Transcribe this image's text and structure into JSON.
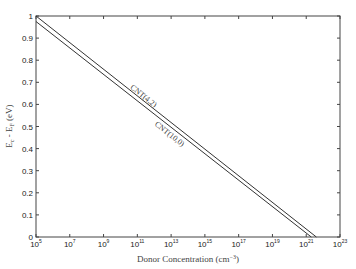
{
  "chart_data": {
    "type": "line",
    "title": "",
    "xlabel": "Donor Concentration (cm⁻³)",
    "ylabel": "Eᴄ - Eғ (eV)",
    "ylabel_parts": {
      "main": "E",
      "sub1": "c",
      "mid": " - E",
      "sub2": "F",
      "unit": " (eV)"
    },
    "xlabel_parts": {
      "main": "Donor Concentration (cm",
      "sup": "−3",
      "end": ")"
    },
    "xscale": "log",
    "xlim_exp": [
      5,
      23
    ],
    "ylim": [
      0,
      1
    ],
    "x_ticks": [
      {
        "base": "10",
        "exp": "5"
      },
      {
        "base": "10",
        "exp": "7"
      },
      {
        "base": "10",
        "exp": "9"
      },
      {
        "base": "10",
        "exp": "11"
      },
      {
        "base": "10",
        "exp": "13"
      },
      {
        "base": "10",
        "exp": "15"
      },
      {
        "base": "10",
        "exp": "17"
      },
      {
        "base": "10",
        "exp": "19"
      },
      {
        "base": "10",
        "exp": "21"
      },
      {
        "base": "10",
        "exp": "23"
      }
    ],
    "y_ticks": [
      "0",
      "0.1",
      "0.2",
      "0.3",
      "0.4",
      "0.5",
      "0.6",
      "0.7",
      "0.8",
      "0.9",
      "1"
    ],
    "grid": false,
    "legend": "none (inline annotations)",
    "series": [
      {
        "name": "CNT(4,2)",
        "x_log10": [
          5,
          21.6
        ],
        "y": [
          1.0,
          0.0
        ],
        "color": "#333333"
      },
      {
        "name": "CNT(10,0)",
        "x_log10": [
          5,
          21.3
        ],
        "y": [
          0.975,
          0.0
        ],
        "color": "#333333"
      }
    ],
    "annotations": [
      {
        "text": "CNT(4,2)",
        "near_x_log10": 12.5,
        "near_y": 0.55
      },
      {
        "text": "CNT(10,0)",
        "near_x_log10": 14.0,
        "near_y": 0.43
      }
    ]
  }
}
